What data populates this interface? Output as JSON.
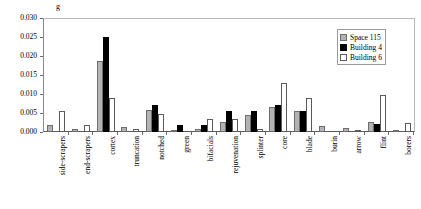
{
  "chart_data": {
    "type": "bar",
    "title": "",
    "subtitle": "",
    "xlabel": "",
    "ylabel": "g",
    "ylim": [
      0,
      0.03
    ],
    "yticks": [
      "0.000",
      "0.005",
      "0.010",
      "0.015",
      "0.020",
      "0.025",
      "0.030"
    ],
    "ytick_values": [
      0,
      0.005,
      0.01,
      0.015,
      0.02,
      0.025,
      0.03
    ],
    "grid": false,
    "legend_position": "top-right",
    "categories": [
      "side-scrapers",
      "end-scrapers",
      "cortex",
      "truncation",
      "notched",
      "green",
      "bifacials",
      "rejuvenation",
      "splinter",
      "core",
      "blade",
      "burin",
      "arrow",
      "flint",
      "borers"
    ],
    "series": [
      {
        "name": "Space 115",
        "color": "#b3b3b3",
        "values": [
          0.0019,
          0.0008,
          0.0188,
          0.0012,
          0.0058,
          0.0006,
          0.0008,
          0.0027,
          0.0046,
          0.0066,
          0.0054,
          0.0015,
          0.001,
          0.0027,
          0.0003
        ]
      },
      {
        "name": "Building 4",
        "color": "#000000",
        "values": [
          0.0,
          0.0,
          0.0251,
          0.0,
          0.0072,
          0.0019,
          0.0019,
          0.0055,
          0.0054,
          0.0071,
          0.0055,
          0.0,
          0.0,
          0.002,
          0.0
        ]
      },
      {
        "name": "Building 6",
        "color": "#ffffff",
        "values": [
          0.0056,
          0.0019,
          0.0089,
          0.0007,
          0.0048,
          0.0,
          0.0033,
          0.0033,
          0.0008,
          0.013,
          0.009,
          0.0,
          0.0006,
          0.0098,
          0.0025
        ]
      }
    ]
  },
  "legend": {
    "items": [
      {
        "label": "Space 115"
      },
      {
        "label": "Building 4"
      },
      {
        "label": "Building 6"
      }
    ]
  }
}
